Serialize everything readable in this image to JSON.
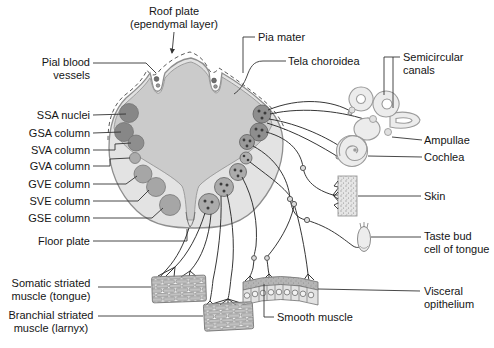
{
  "figure": {
    "labels": {
      "roof_plate": "Roof plate\n(ependymal layer)",
      "pia_mater": "Pia mater",
      "tela_choroidea": "Tela choroidea",
      "pial_blood_vessels": "Pial blood\nvessels",
      "ssa_nuclei": "SSA nuclei",
      "gsa_column": "GSA column",
      "sva_column": "SVA column",
      "gva_column": "GVA column",
      "gve_column": "GVE column",
      "sve_column": "SVE column",
      "gse_column": "GSE column",
      "floor_plate": "Floor plate",
      "semicircular_canals": "Semicircular\ncanals",
      "ampullae": "Ampullae",
      "cochlea": "Cochlea",
      "skin": "Skin",
      "taste_bud": "Taste bud\ncell of tongue",
      "visceral_epithelium": "Visceral\nopithelium",
      "smooth_muscle": "Smooth muscle",
      "somatic_striated_muscle": "Somatic striated\nmuscle (tongue)",
      "branchial_striated_muscle": "Branchial striated\nmuscle (larnyx)"
    },
    "colors": {
      "background": "#ffffff",
      "marginal_layer": "#e3e3e3",
      "mantle_layer": "#cbcbcb",
      "dark_nucleus": "#878787",
      "light_nucleus": "#a6a6a6",
      "outline": "#8e8e8e",
      "nerve_line": "#2b2b2b",
      "label_text": "#151515"
    }
  }
}
